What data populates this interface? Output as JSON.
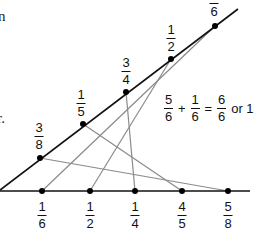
{
  "text_fragments": {
    "top_left": "n",
    "mid_left": "r."
  },
  "upper_line_points": [
    {
      "label_num": "3",
      "label_den": "8",
      "x": 40,
      "y": 158
    },
    {
      "label_num": "1",
      "label_den": "5",
      "x": 83,
      "y": 124
    },
    {
      "label_num": "3",
      "label_den": "4",
      "x": 126,
      "y": 92
    },
    {
      "label_num": "1",
      "label_den": "2",
      "x": 171,
      "y": 59
    },
    {
      "label_num": "5",
      "label_den": "6",
      "x": 215,
      "y": 26
    }
  ],
  "lower_line_points": [
    {
      "label_num": "1",
      "label_den": "6",
      "x": 42,
      "y": 191
    },
    {
      "label_num": "1",
      "label_den": "2",
      "x": 90,
      "y": 191
    },
    {
      "label_num": "1",
      "label_den": "4",
      "x": 135,
      "y": 191
    },
    {
      "label_num": "4",
      "label_den": "5",
      "x": 182,
      "y": 191
    },
    {
      "label_num": "5",
      "label_den": "8",
      "x": 228,
      "y": 191
    }
  ],
  "connections": [
    {
      "from": "3/8",
      "to": "5/8"
    },
    {
      "from": "1/5",
      "to": "4/5"
    },
    {
      "from": "3/4",
      "to": "1/4"
    },
    {
      "from": "1/2",
      "to": "1/2"
    },
    {
      "from": "5/6",
      "to": "1/6"
    }
  ],
  "equation": {
    "a_num": "5",
    "a_den": "6",
    "plus": "+",
    "b_num": "1",
    "b_den": "6",
    "equals": "=",
    "c_num": "6",
    "c_den": "6",
    "tail": "or 1"
  },
  "colors": {
    "axis": "#111111",
    "connector": "#8a8a8a",
    "dot": "#000000"
  }
}
